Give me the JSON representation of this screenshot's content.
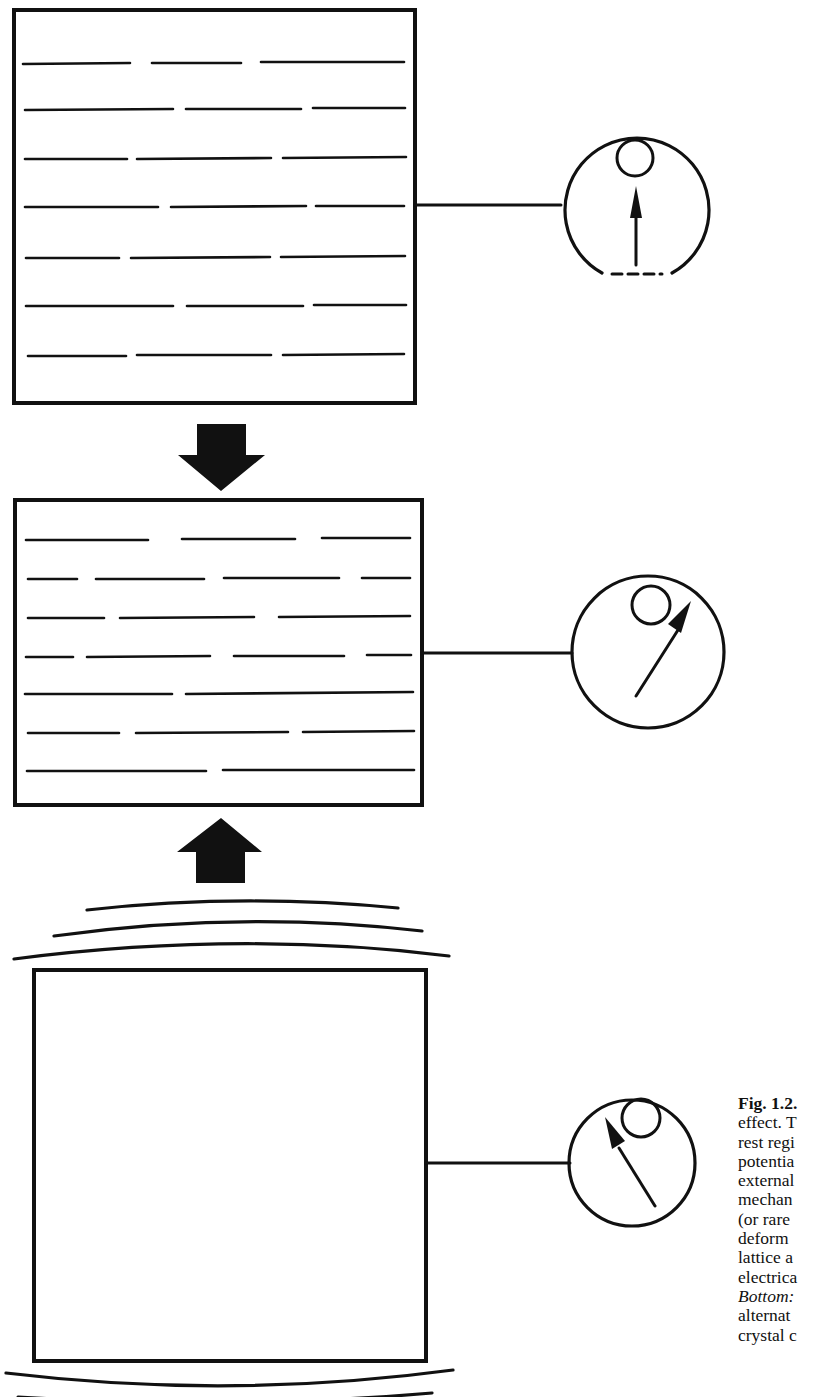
{
  "figure": {
    "label": "Fig. 1.2.",
    "caption_lines": [
      {
        "text": "effect. T",
        "style": "normal"
      },
      {
        "text": "rest regi",
        "style": "normal"
      },
      {
        "text": "potentia",
        "style": "normal"
      },
      {
        "text": "external",
        "style": "normal"
      },
      {
        "text": "mechan",
        "style": "normal"
      },
      {
        "text": "(or rare",
        "style": "normal"
      },
      {
        "text": "deform",
        "style": "normal"
      },
      {
        "text": "lattice a",
        "style": "normal"
      },
      {
        "text": "electrica",
        "style": "normal"
      },
      {
        "text": "Bottom:",
        "style": "italic"
      },
      {
        "text": "alternat",
        "style": "normal"
      },
      {
        "text": "crystal c",
        "style": "normal"
      }
    ],
    "panels": [
      {
        "name": "top",
        "state": "rest",
        "crystal": "lattice-lines",
        "meter_needle": "center-up",
        "force_arrow": "down-below"
      },
      {
        "name": "middle",
        "state": "compressed",
        "crystal": "lattice-lines-deformed",
        "meter_needle": "deflected-right",
        "force_arrows": [
          "down-above",
          "up-below"
        ]
      },
      {
        "name": "bottom",
        "state": "vibrating",
        "crystal": "plain-block",
        "meter_needle": "deflected-left",
        "vibration_arcs": "above-and-below"
      }
    ],
    "colors": {
      "ink": "#111111",
      "paper": "#ffffff"
    }
  }
}
